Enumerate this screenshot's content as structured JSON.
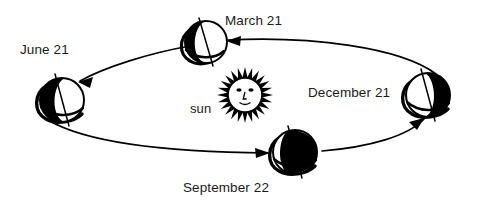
{
  "diagram": {
    "center_body": {
      "name": "sun",
      "label": "sun",
      "icon": "sun-face-icon",
      "cx": 245,
      "cy": 95,
      "core_radius": 16,
      "ray_count": 24,
      "ray_length": 11
    },
    "orbit": {
      "shape": "ellipse",
      "cx": 243,
      "cy": 98,
      "rx": 198,
      "ry": 58,
      "stroke": "#000000",
      "stroke_width": 1.6,
      "direction": "counterclockwise",
      "arrow_count": 4
    },
    "earth_positions": [
      {
        "id": "march",
        "label": "March 21",
        "season_event": "equinox",
        "cx": 206,
        "cy": 42,
        "r": 21,
        "lit_side": "right",
        "dark_side": "left",
        "axis_tilt_deg": 23.5
      },
      {
        "id": "june",
        "label": "June 21",
        "season_event": "solstice",
        "cx": 62,
        "cy": 100,
        "r": 22,
        "lit_side": "right",
        "dark_side": "left",
        "axis_tilt_deg": 23.5
      },
      {
        "id": "september",
        "label": "September 22",
        "season_event": "equinox",
        "cx": 295,
        "cy": 152,
        "r": 22,
        "lit_side": "left",
        "dark_side": "right",
        "axis_tilt_deg": 23.5
      },
      {
        "id": "december",
        "label": "December 21",
        "season_event": "solstice",
        "cx": 428,
        "cy": 95,
        "r": 22,
        "lit_side": "left",
        "dark_side": "right",
        "axis_tilt_deg": 23.5
      }
    ],
    "colors": {
      "ink": "#000000",
      "background": "#ffffff",
      "label_text": "#1b1b1b",
      "shadow_fill": "#000000",
      "lit_fill": "#ffffff"
    }
  }
}
